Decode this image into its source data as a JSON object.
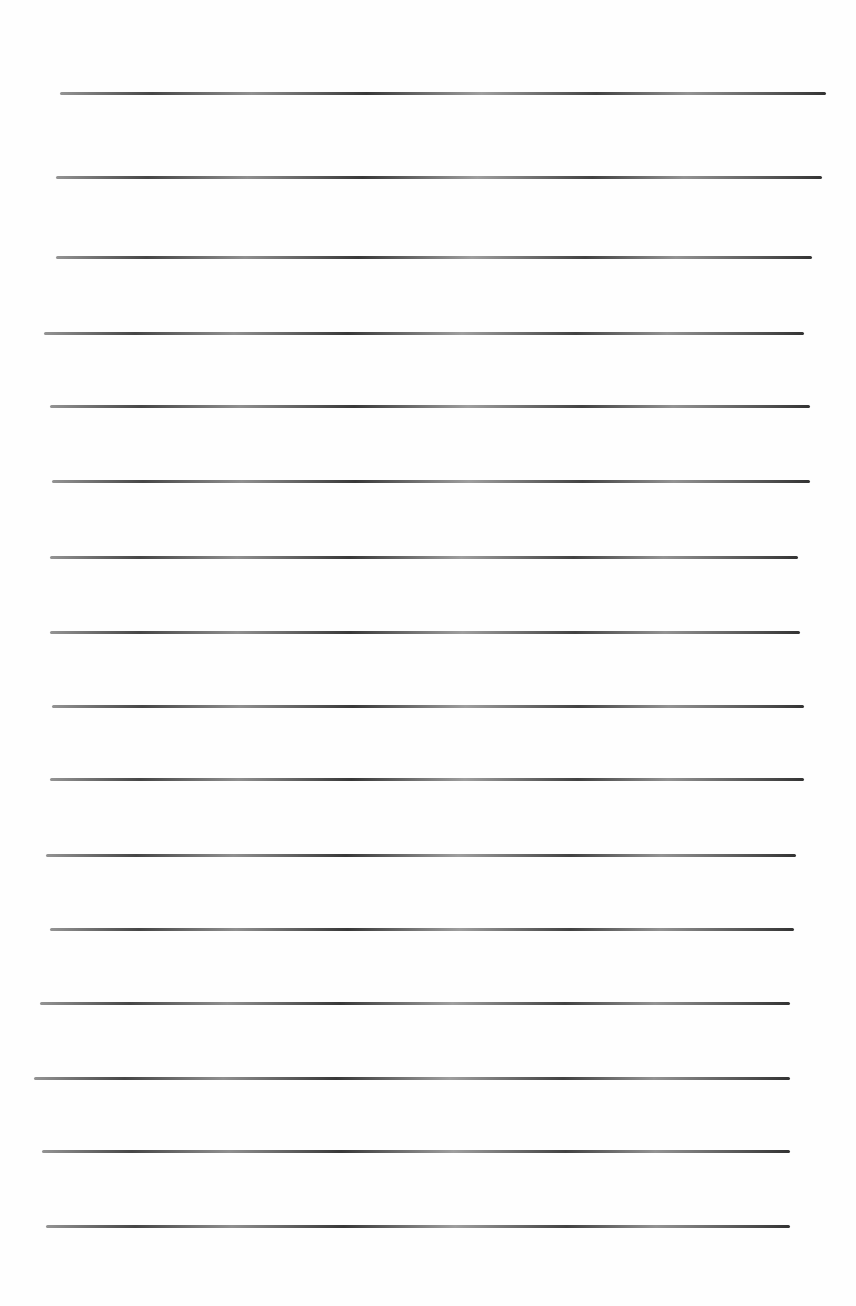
{
  "page": {
    "type": "blank-lined-paper",
    "background_color": "#fefefe",
    "line_color": "#3c3c3c",
    "line_count": 16
  },
  "lines": [
    {
      "y": 93,
      "x1": 60,
      "x2": 826
    },
    {
      "y": 177,
      "x1": 56,
      "x2": 822
    },
    {
      "y": 257,
      "x1": 56,
      "x2": 812
    },
    {
      "y": 333,
      "x1": 44,
      "x2": 804
    },
    {
      "y": 406,
      "x1": 50,
      "x2": 810
    },
    {
      "y": 481,
      "x1": 52,
      "x2": 810
    },
    {
      "y": 557,
      "x1": 50,
      "x2": 798
    },
    {
      "y": 632,
      "x1": 50,
      "x2": 800
    },
    {
      "y": 706,
      "x1": 52,
      "x2": 804
    },
    {
      "y": 779,
      "x1": 50,
      "x2": 804
    },
    {
      "y": 855,
      "x1": 46,
      "x2": 796
    },
    {
      "y": 929,
      "x1": 50,
      "x2": 794
    },
    {
      "y": 1003,
      "x1": 40,
      "x2": 790
    },
    {
      "y": 1078,
      "x1": 34,
      "x2": 790
    },
    {
      "y": 1151,
      "x1": 42,
      "x2": 790
    },
    {
      "y": 1226,
      "x1": 46,
      "x2": 790
    }
  ]
}
